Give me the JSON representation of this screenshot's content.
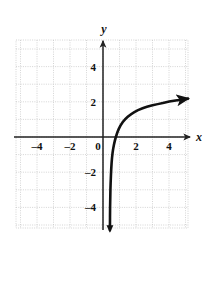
{
  "figure": {
    "kind": "cartesian-graph",
    "background": "#ffffff",
    "curve_color": "#111111",
    "axis_color": "#222222",
    "grid_color": "#c9c9c9",
    "plot_box": {
      "x0": 16,
      "y0": 40,
      "x1": 188,
      "y1": 228
    }
  },
  "axes": {
    "x_label": "x",
    "y_label": "y",
    "x_label_pos": {
      "x": 199,
      "y": 141
    },
    "y_label_pos": {
      "x": 104,
      "y": 33
    },
    "origin_px": {
      "x": 103,
      "y": 137
    },
    "unit_px": {
      "x": 16.5,
      "y": 17.6
    }
  },
  "chart_data": {
    "type": "line",
    "title": "",
    "xlabel": "x",
    "ylabel": "y",
    "xlim": [
      -5.3,
      5.2
    ],
    "ylim": [
      -5.5,
      5.5
    ],
    "grid": true,
    "grid_style": "dotted",
    "legend": "none",
    "x_ticks": [
      -4,
      -2,
      0,
      2,
      4
    ],
    "x_tick_labels": [
      "–4",
      "–2",
      "0",
      "2",
      "4"
    ],
    "y_ticks": [
      4,
      2,
      -2,
      -4
    ],
    "y_tick_labels": [
      "4",
      "2",
      "–2",
      "–4"
    ],
    "series": [
      {
        "name": "logarithmic curve",
        "description": "increasing logarithmic curve with vertical asymptote at x = 0",
        "arrow_start": false,
        "arrow_end": true,
        "points": [
          {
            "x": 0.42,
            "y": -5.3
          },
          {
            "x": 0.43,
            "y": -4.0
          },
          {
            "x": 0.45,
            "y": -3.0
          },
          {
            "x": 0.48,
            "y": -2.2
          },
          {
            "x": 0.52,
            "y": -1.5
          },
          {
            "x": 0.58,
            "y": -0.9
          },
          {
            "x": 0.66,
            "y": -0.45
          },
          {
            "x": 0.78,
            "y": 0.0
          },
          {
            "x": 0.95,
            "y": 0.45
          },
          {
            "x": 1.2,
            "y": 0.85
          },
          {
            "x": 1.5,
            "y": 1.15
          },
          {
            "x": 1.9,
            "y": 1.42
          },
          {
            "x": 2.4,
            "y": 1.63
          },
          {
            "x": 3.0,
            "y": 1.8
          },
          {
            "x": 3.7,
            "y": 1.95
          },
          {
            "x": 4.4,
            "y": 2.07
          },
          {
            "x": 5.15,
            "y": 2.18
          }
        ]
      }
    ]
  }
}
